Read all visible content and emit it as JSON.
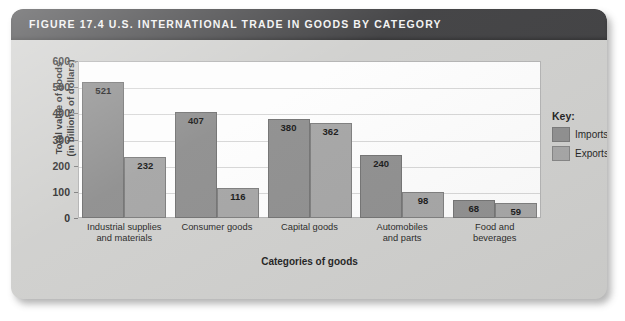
{
  "figure": {
    "label": "FIGURE 17.4",
    "title": "FIGURE 17.4  U.S. INTERNATIONAL TRADE IN GOODS BY CATEGORY",
    "source_note": "Source: U.S. Bureau of Economic Analysis, 2005 data"
  },
  "legend": {
    "title": "Key:",
    "items": [
      {
        "label": "Imports",
        "color": "#8d8d8d"
      },
      {
        "label": "Exports",
        "color": "#a4a4a4"
      }
    ]
  },
  "chart_data": {
    "type": "bar",
    "title": "U.S. INTERNATIONAL TRADE IN GOODS BY CATEGORY",
    "xlabel": "Categories of goods",
    "ylabel": "Total value of goods (in billions of dollars)",
    "ylabel_line1": "Total value of goods",
    "ylabel_line2": "(in billions of dollars)",
    "ylim": [
      0,
      600
    ],
    "yticks": [
      0,
      100,
      200,
      300,
      400,
      500,
      600
    ],
    "ytick_labels": [
      "0",
      "100",
      "200",
      "300",
      "400",
      "500",
      "600"
    ],
    "grid": true,
    "legend_position": "right",
    "units": "billions of dollars",
    "categories": [
      "Industrial supplies and materials",
      "Consumer goods",
      "Capital goods",
      "Automobiles and parts",
      "Food and beverages"
    ],
    "category_lines": [
      [
        "Industrial supplies",
        "and materials"
      ],
      [
        "Consumer goods",
        ""
      ],
      [
        "Capital goods",
        ""
      ],
      [
        "Automobiles",
        "and parts"
      ],
      [
        "Food and",
        "beverages"
      ]
    ],
    "series": [
      {
        "name": "Imports",
        "color": "#8d8d8d",
        "values": [
          521,
          407,
          380,
          240,
          68
        ],
        "value_labels": [
          "521",
          "407",
          "380",
          "240",
          "68"
        ]
      },
      {
        "name": "Exports",
        "color": "#a4a4a4",
        "values": [
          232,
          116,
          362,
          98,
          59
        ],
        "value_labels": [
          "232",
          "116",
          "362",
          "98",
          "59"
        ]
      }
    ]
  }
}
